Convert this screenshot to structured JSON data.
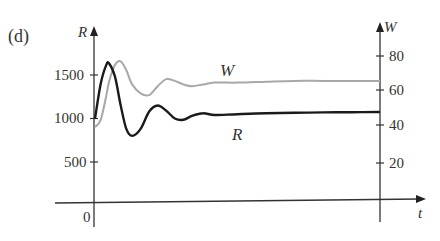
{
  "panel_label": "(d)",
  "chart_data": {
    "type": "line",
    "title": "",
    "xlabel": "t",
    "ylabel_left": "R",
    "ylabel_right": "W",
    "x_ticks": [
      "0"
    ],
    "y_left_ticks": [
      500,
      1000,
      1500
    ],
    "y_left_tick_labels": [
      "500",
      "1000",
      "1500"
    ],
    "y_right_ticks": [
      20,
      40,
      60,
      80
    ],
    "y_right_tick_labels": [
      "20",
      "40",
      "60",
      "80"
    ],
    "ylim_left": [
      0,
      1850
    ],
    "ylim_right": [
      0,
      100
    ],
    "xlim": [
      0,
      1
    ],
    "grid": false,
    "legend": "inline labels",
    "x": [
      0,
      0.02,
      0.04,
      0.05,
      0.07,
      0.09,
      0.11,
      0.13,
      0.16,
      0.19,
      0.22,
      0.25,
      0.28,
      0.31,
      0.34,
      0.38,
      0.42,
      0.5,
      0.6,
      0.7,
      0.8,
      0.9,
      1.0
    ],
    "series": [
      {
        "name": "R",
        "axis": "left",
        "color": "#1a1a1a",
        "values": [
          1000,
          1400,
          1620,
          1630,
          1480,
          1150,
          880,
          800,
          880,
          1080,
          1150,
          1090,
          1000,
          985,
          1030,
          1060,
          1040,
          1050,
          1060,
          1065,
          1070,
          1072,
          1075
        ]
      },
      {
        "name": "W",
        "axis": "right",
        "color": "#a8a8a8",
        "values": [
          40,
          44,
          58,
          66,
          75,
          77,
          72,
          64,
          59,
          58,
          63,
          67,
          66,
          64,
          63,
          64,
          65,
          65,
          65.5,
          66,
          66,
          66,
          66
        ]
      }
    ],
    "annotations": [
      {
        "text": "W",
        "near_series": "W"
      },
      {
        "text": "R",
        "near_series": "R"
      }
    ]
  }
}
